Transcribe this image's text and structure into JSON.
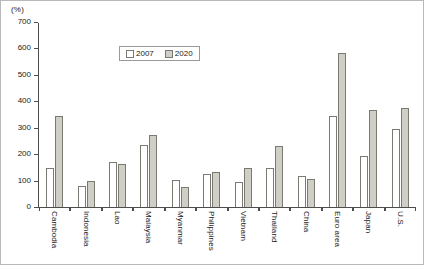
{
  "unit_label": "(%)",
  "legend": {
    "entries": [
      {
        "label": "2007",
        "swatch": "legend-swatch-2007"
      },
      {
        "label": "2020",
        "swatch": "legend-swatch-2020"
      }
    ]
  },
  "colors": {
    "series_2007": "#ffffff",
    "series_2020": "#cfcfc6",
    "bar_outline": "#7a7a72",
    "axis": "#4d4d4d",
    "frame": "#b9b9b9"
  },
  "y_axis": {
    "ticks": [
      0,
      100,
      200,
      300,
      400,
      500,
      600,
      700
    ]
  },
  "chart_data": {
    "type": "bar",
    "title": "",
    "subtitle": "",
    "xlabel": "",
    "ylabel": "(%)",
    "ylim": [
      0,
      700
    ],
    "ytick_step": 100,
    "grid": false,
    "legend_position": "top-center",
    "categories": [
      "Cambodia",
      "Indonesia",
      "Lao",
      "Malaysia",
      "Myanmar",
      "Philippines",
      "Vietnam",
      "Thailand",
      "China",
      "Euro area",
      "Japan",
      "U.S."
    ],
    "series": [
      {
        "name": "2007",
        "values": [
          152,
          82,
          175,
          237,
          105,
          130,
          100,
          150,
          120,
          348,
          195,
          300
        ]
      },
      {
        "name": "2020",
        "values": [
          348,
          103,
          167,
          277,
          78,
          135,
          152,
          235,
          110,
          585,
          372,
          380
        ]
      }
    ]
  }
}
